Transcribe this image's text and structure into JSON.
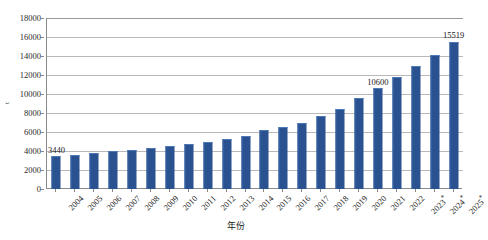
{
  "chart_data": {
    "type": "bar",
    "title": "",
    "xlabel": "年份",
    "ylabel": "t",
    "ylim": [
      0,
      18000
    ],
    "ytick_step": 2000,
    "yticks": [
      "0",
      "2000",
      "4000",
      "6000",
      "8000",
      "10000",
      "12000",
      "14000",
      "16000",
      "18000"
    ],
    "grid": true,
    "legend": "none",
    "bar_color": "#2a5190",
    "categories": [
      "2004",
      "2005",
      "2006",
      "2007",
      "2008",
      "2009",
      "2010",
      "2011",
      "2012",
      "2013",
      "2014",
      "2015",
      "2016",
      "2017",
      "2018",
      "2019",
      "2020",
      "2021",
      "2022",
      "2023*",
      "2024*",
      "2025*"
    ],
    "values": [
      3440,
      3590,
      3780,
      3980,
      4130,
      4350,
      4560,
      4790,
      4980,
      5250,
      5600,
      6180,
      6480,
      6920,
      7650,
      8450,
      9550,
      10600,
      11800,
      12900,
      14100,
      15519
    ],
    "data_labels": [
      {
        "category": "2004",
        "value": 3440,
        "text": "3440"
      },
      {
        "category": "2021",
        "value": 10600,
        "text": "10600"
      },
      {
        "category": "2025*",
        "value": 15519,
        "text": "15519"
      }
    ],
    "annotations": [
      "* 表示预测值"
    ]
  },
  "axes": {
    "y_axis_title": "t",
    "x_axis_title": "年份"
  }
}
